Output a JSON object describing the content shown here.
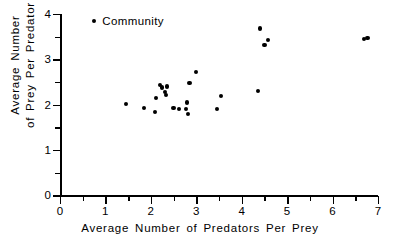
{
  "chart_data": {
    "type": "scatter",
    "title": "",
    "xlabel": "Average Number of Predators Per Prey",
    "ylabel_lines": [
      "Average Number",
      "of Prey Per Predator"
    ],
    "ylabel": "Average Number of Prey Per Predator",
    "xlim": [
      0,
      7
    ],
    "ylim": [
      0,
      4
    ],
    "xticks": [
      0,
      1,
      2,
      3,
      4,
      5,
      6,
      7
    ],
    "xtick_labels": [
      "0",
      "1",
      "2",
      "3",
      "4",
      "5",
      "6",
      "7"
    ],
    "x_minor_ticks": [
      0.5,
      1.5,
      2.5,
      3.5,
      4.5,
      5.5,
      6.5
    ],
    "yticks": [
      0,
      1,
      2,
      3,
      4
    ],
    "ytick_labels": [
      "0",
      "1",
      "2",
      "3",
      "4"
    ],
    "y_minor_ticks": [
      0.5,
      1.5,
      2.5,
      3.5
    ],
    "grid": false,
    "legend_position": "top-left",
    "series": [
      {
        "name": "Community",
        "marker": "circle",
        "color": "#000000",
        "points": [
          {
            "x": 1.45,
            "y": 2.01
          },
          {
            "x": 1.85,
            "y": 1.92
          },
          {
            "x": 2.1,
            "y": 1.84
          },
          {
            "x": 2.12,
            "y": 2.15
          },
          {
            "x": 2.2,
            "y": 2.44
          },
          {
            "x": 2.25,
            "y": 2.38
          },
          {
            "x": 2.32,
            "y": 2.28
          },
          {
            "x": 2.33,
            "y": 2.22
          },
          {
            "x": 2.35,
            "y": 2.4
          },
          {
            "x": 2.5,
            "y": 1.93
          },
          {
            "x": 2.62,
            "y": 1.9
          },
          {
            "x": 2.78,
            "y": 1.9
          },
          {
            "x": 2.8,
            "y": 2.05
          },
          {
            "x": 2.82,
            "y": 1.79
          },
          {
            "x": 2.85,
            "y": 2.48
          },
          {
            "x": 3.0,
            "y": 2.72
          },
          {
            "x": 3.45,
            "y": 1.9
          },
          {
            "x": 3.55,
            "y": 2.19
          },
          {
            "x": 4.35,
            "y": 2.3
          },
          {
            "x": 4.4,
            "y": 3.68
          },
          {
            "x": 4.5,
            "y": 3.32
          },
          {
            "x": 4.58,
            "y": 3.42
          },
          {
            "x": 6.7,
            "y": 3.44
          },
          {
            "x": 6.77,
            "y": 3.47
          }
        ]
      }
    ]
  },
  "legend": {
    "entries": [
      {
        "label": "Community",
        "marker_color": "#000000"
      }
    ]
  },
  "colors": {
    "axis": "#000000",
    "marker": "#000000",
    "background": "#ffffff"
  }
}
